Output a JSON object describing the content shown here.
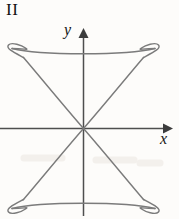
{
  "figure": {
    "panel_label": "II",
    "background_color": "#fdfcfa",
    "curve_color": "#7b7b7b",
    "axis_color": "#4e4e4e",
    "axes": {
      "x_label": "x",
      "y_label": "y",
      "x_arrow": "right-arrow-icon",
      "y_arrow": "up-arrow-icon",
      "origin": {
        "x": 83,
        "y": 128
      },
      "x_axis_extent": {
        "from_x": 0,
        "to_x": 172
      },
      "y_axis_extent": {
        "from_y": 30,
        "to_y": 216
      },
      "ticks": [],
      "tick_labels": []
    },
    "curve": {
      "name": "four-loop-hourglass-curve",
      "description": "Closed parametric curve crossing itself at the origin, with two arcs sweeping up-left and up-right and two sweeping down-left and down-right, joined by gentle horizontal arcs across the top and bottom, and a small loop at each of the four extremities.",
      "self_intersection": {
        "x": 83,
        "y": 128
      },
      "loops": [
        {
          "name": "loop-top-left",
          "cx": 17,
          "cy": 52
        },
        {
          "name": "loop-top-right",
          "cx": 150,
          "cy": 52
        },
        {
          "name": "loop-bottom-left",
          "cx": 17,
          "cy": 205
        },
        {
          "name": "loop-bottom-right",
          "cx": 150,
          "cy": 205
        }
      ],
      "top_arc_y_crossing": 51,
      "bottom_arc_y_crossing": 205
    }
  }
}
